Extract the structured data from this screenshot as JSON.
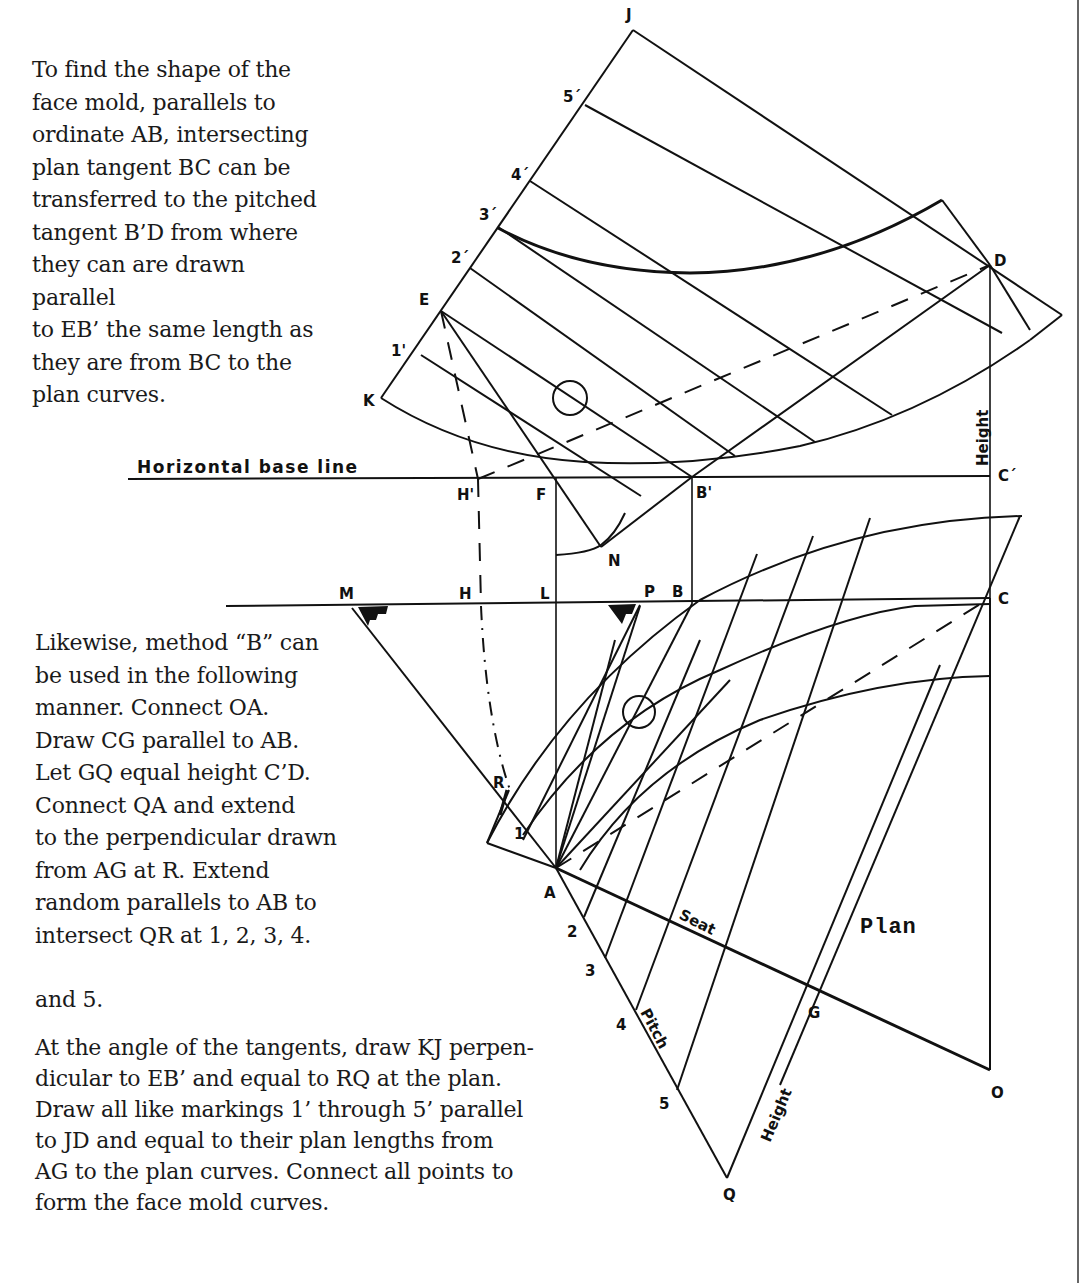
{
  "text": {
    "paragraph_1": "To find the shape of the\nface mold, parallels to\nordinate AB, intersecting\nplan tangent BC can be\ntransferred to the pitched\ntangent B’D from where\nthey can are drawn parallel\nto EB’ the same length as\nthey are from BC to the\nplan curves.",
    "paragraph_2": "Likewise, method “B” can\nbe used in the following\nmanner. Connect OA.\nDraw CG parallel to AB.\nLet GQ equal height C’D.\nConnect QA and extend\nto the perpendicular drawn\nfrom AG at R. Extend\nrandom parallels to AB to\nintersect QR at 1, 2, 3, 4.",
    "paragraph_2_end": "and 5.",
    "paragraph_3": "At the angle of the tangents, draw KJ perpen-\ndicular to EB’ and equal to RQ at the plan.\nDraw all like markings 1’ through 5’ parallel\nto JD and equal to their plan lengths from\nAG to the plan curves. Connect all points to\nform the face mold curves."
  },
  "diagram": {
    "annotations": {
      "horizontal_base_line": "Horizontal base line",
      "height_upper": "Height",
      "height_lower": "Height",
      "seat": "Seat",
      "pitch": "Pitch",
      "plan": "Plan"
    },
    "points": {
      "J": "J",
      "E": "E",
      "K": "K",
      "D": "D",
      "five_prime": "5´",
      "four_prime": "4´",
      "three_prime": "3´",
      "two_prime": "2´",
      "one_prime": "1'",
      "H_prime": "H'",
      "F": "F",
      "B_prime": "B'",
      "C_prime": "C´",
      "N": "N",
      "M": "M",
      "H": "H",
      "L": "L",
      "P": "P",
      "B": "B",
      "C": "C",
      "R": "R",
      "one": "1",
      "A": "A",
      "two": "2",
      "three": "3",
      "four": "4",
      "five": "5",
      "G": "G",
      "O": "O",
      "Q": "Q"
    }
  }
}
